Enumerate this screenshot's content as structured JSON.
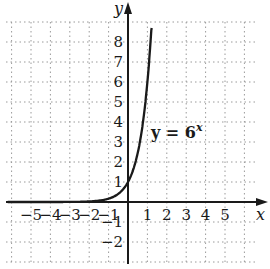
{
  "chart_data": {
    "type": "line",
    "title": "",
    "xlabel": "x",
    "ylabel": "y",
    "xlim": [
      -6.3,
      6.8
    ],
    "ylim": [
      -3.1,
      10
    ],
    "grid": true,
    "x_ticks": [
      "-5",
      "-4",
      "-3",
      "-2",
      "-1",
      "1",
      "2",
      "3",
      "4",
      "5"
    ],
    "y_ticks": [
      "-2",
      "-1",
      "1",
      "2",
      "3",
      "4",
      "5",
      "6",
      "7",
      "8"
    ],
    "annotation": {
      "text_main": "y = 6",
      "text_exp": "x",
      "x": 1.2,
      "y": 3.3
    },
    "series": [
      {
        "name": "y = 6^x",
        "function": "6^x",
        "x": [
          -6.2,
          -5,
          -4,
          -3,
          -2,
          -1,
          -0.5,
          0,
          0.25,
          0.5,
          0.75,
          1,
          1.25,
          1.5
        ],
        "y": [
          2e-05,
          0.00013,
          0.00077,
          0.0046,
          0.028,
          0.167,
          0.408,
          1,
          1.565,
          2.449,
          3.834,
          6,
          9.39,
          14.7
        ]
      }
    ]
  },
  "labels": {
    "y_axis": "y",
    "x_axis": "x",
    "equation_main": "y = 6",
    "equation_exp": "x"
  }
}
